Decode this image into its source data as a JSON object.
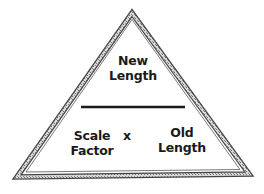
{
  "diagram": {
    "type": "formula-triangle",
    "top": {
      "line1": "New",
      "line2": "Length"
    },
    "bottom_left": {
      "line1": "Scale",
      "line2": "Factor"
    },
    "operator": "x",
    "bottom_right": {
      "line1": "Old",
      "line2": "Length"
    }
  },
  "colors": {
    "border": "#555555",
    "border_fill": "#bdbdbd",
    "divider": "#1a1a1a",
    "text": "#1a1a1a"
  }
}
